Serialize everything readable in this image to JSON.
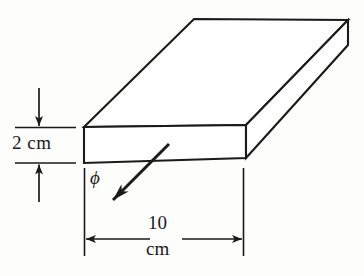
{
  "figure": {
    "type": "engineering-dimension-diagram",
    "background_color": "#fdfdfc",
    "line_color": "#1a1a1a"
  },
  "dimensions": {
    "thickness": {
      "value": "2 cm",
      "orientation": "vertical",
      "arrow_style": "inward-pointing"
    },
    "length": {
      "value": "10",
      "unit": "cm",
      "orientation": "horizontal",
      "arrow_style": "outward-pointing"
    }
  },
  "annotations": {
    "flux_symbol": "ϕ",
    "flux_symbol_name": "phi",
    "flux_arrow_direction": "down-left"
  },
  "solid": {
    "name": "rectangular-slab",
    "visible_faces": [
      "top",
      "front",
      "right"
    ],
    "vertices": {
      "front_top_left": [
        84,
        127
      ],
      "front_top_right": [
        246,
        125
      ],
      "front_bottom_right": [
        246,
        158
      ],
      "front_bottom_left": [
        84,
        163
      ],
      "back_top_left": [
        194,
        19
      ],
      "back_top_right": [
        348,
        20
      ],
      "back_bottom_right": [
        348,
        45
      ]
    }
  }
}
